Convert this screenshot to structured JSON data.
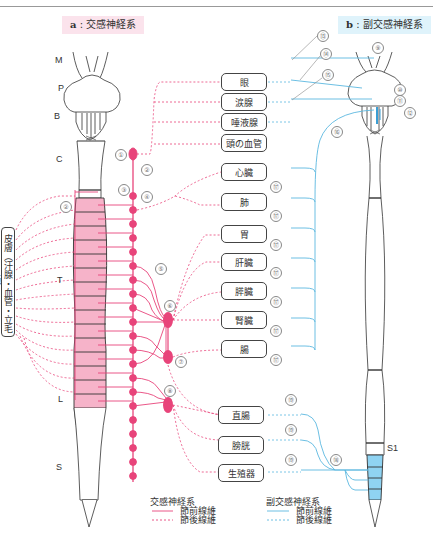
{
  "caption_top": "",
  "panel_a": {
    "letter": "a",
    "title": "交感神経系"
  },
  "panel_b": {
    "letter": "b",
    "title": "副交感神経系"
  },
  "brain_labels": {
    "M": "M",
    "P": "P",
    "B": "B"
  },
  "segments_a": {
    "C": "C",
    "T": "T",
    "L": "L",
    "S": "S"
  },
  "segments_b": {
    "S1": "S1"
  },
  "skin_label": "皮膚（汗腺・血管・立毛筋）",
  "organs": [
    {
      "id": "eye",
      "label": "眼"
    },
    {
      "id": "lacrimal",
      "label": "涙腺"
    },
    {
      "id": "salivary",
      "label": "唾液腺"
    },
    {
      "id": "head_vessels",
      "label": "頭の血管"
    },
    {
      "id": "heart",
      "label": "心臓"
    },
    {
      "id": "lung",
      "label": "肺"
    },
    {
      "id": "stomach",
      "label": "胃"
    },
    {
      "id": "liver",
      "label": "肝臓"
    },
    {
      "id": "pancreas",
      "label": "膵臓"
    },
    {
      "id": "kidney",
      "label": "腎臓"
    },
    {
      "id": "intestine",
      "label": "腸"
    },
    {
      "id": "rectum",
      "label": "直腸"
    },
    {
      "id": "bladder",
      "label": "膀胱"
    },
    {
      "id": "genitals",
      "label": "生殖器"
    }
  ],
  "numbers": {
    "n1": "①",
    "n2": "②",
    "n2b": "②",
    "n3": "③",
    "n4": "④",
    "n5": "⑤",
    "n6": "⑥",
    "n7": "⑦",
    "n8": "⑧",
    "n9": "⑨",
    "n10": "⑩",
    "n11": "⑪",
    "n12": "⑫",
    "n13": "⑬",
    "n14": "⑭",
    "n15": "⑮",
    "n16": "⑯",
    "n17": "⑰",
    "n18": "⑱",
    "n19": "⑲"
  },
  "legend": {
    "sympathetic": {
      "title": "交感神経系",
      "pre": "節前線維",
      "post": "節後線維"
    },
    "parasympathetic": {
      "title": "副交感神経系",
      "pre": "節前線維",
      "post": "節後線維"
    }
  },
  "colors": {
    "sympathetic": "#e8447a",
    "sympathetic_fill": "#f6b3c9",
    "parasympathetic": "#5bb8e0",
    "parasympathetic_fill": "#8fd3f2",
    "outline": "#333333"
  }
}
